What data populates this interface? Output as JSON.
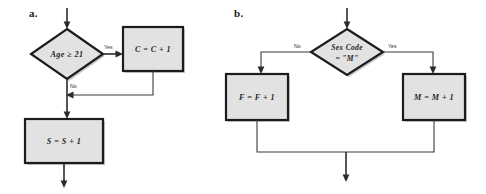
{
  "figure": {
    "type": "flowchart",
    "background_color": "#ffffff",
    "node_fill_color": "#e2e2e2",
    "node_border_color": "#1c1c1c",
    "connector_color": "#3a3a3a"
  },
  "panels": [
    {
      "id": "a",
      "label": "a.",
      "decision": {
        "text": "Age ≥ 21",
        "shape": "diamond"
      },
      "branches": [
        {
          "label": "Yes",
          "target": "C = C + 1"
        },
        {
          "label": "No",
          "target": "S = S + 1"
        }
      ],
      "processes": [
        {
          "text": "C = C + 1",
          "shape": "rectangle"
        },
        {
          "text": "S = S + 1",
          "shape": "rectangle"
        }
      ]
    },
    {
      "id": "b",
      "label": "b.",
      "decision": {
        "text_line1": "Sex Code",
        "text_line2": "= \"M\"",
        "shape": "diamond"
      },
      "branches": [
        {
          "label": "No",
          "target": "F = F + 1"
        },
        {
          "label": "Yes",
          "target": "M = M + 1"
        }
      ],
      "processes": [
        {
          "text": "F = F + 1",
          "shape": "rectangle"
        },
        {
          "text": "M = M + 1",
          "shape": "rectangle"
        }
      ]
    }
  ]
}
